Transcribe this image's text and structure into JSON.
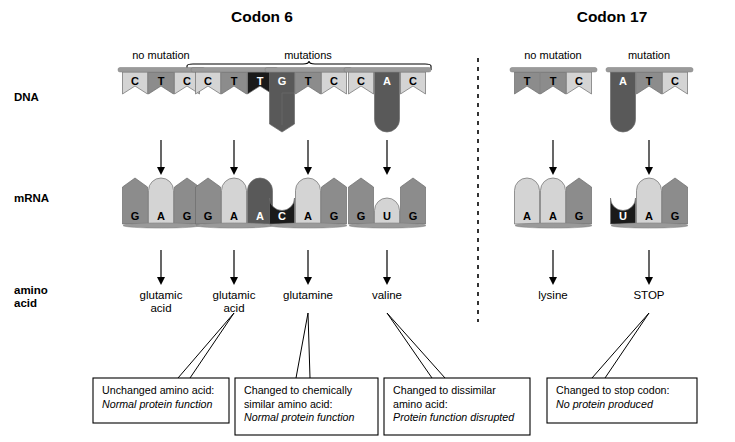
{
  "figure": {
    "width": 735,
    "height": 442,
    "background": "#ffffff"
  },
  "panels": [
    {
      "id": "codon6",
      "title": "Codon 6",
      "title_x": 262,
      "title_y": 22
    },
    {
      "id": "codon17",
      "title": "Codon 17",
      "title_x": 612,
      "title_y": 22
    }
  ],
  "divider": {
    "x": 478,
    "y1": 58,
    "y2": 322,
    "style": "dashed",
    "color": "#000000"
  },
  "row_labels": [
    {
      "name": "dna",
      "lines": [
        "DNA"
      ],
      "x": 14,
      "y": 101
    },
    {
      "name": "mrna",
      "lines": [
        "mRNA"
      ],
      "x": 14,
      "y": 202
    },
    {
      "name": "amino-acid",
      "lines": [
        "amino",
        "acid"
      ],
      "x": 14,
      "y": 294
    }
  ],
  "column_headers": [
    {
      "label": "no mutation",
      "x": 161,
      "y": 59
    },
    {
      "label": "mutations",
      "x": 308,
      "y": 59
    },
    {
      "label": "no mutation",
      "x": 553,
      "y": 59
    },
    {
      "label": "mutation",
      "x": 649,
      "y": 59
    }
  ],
  "bracket": {
    "x1": 187,
    "x2": 431,
    "y": 70,
    "peak_y": 63,
    "label": "mutations"
  },
  "columns": [
    {
      "id": "col1",
      "center": 161,
      "dna": {
        "backbone_x1": 118,
        "backbone_x2": 205,
        "backbone_y": 71,
        "bases": [
          {
            "letter": "C",
            "shade": "light",
            "shape": "flag"
          },
          {
            "letter": "T",
            "shade": "medium",
            "shape": "flag"
          },
          {
            "letter": "C",
            "shade": "light",
            "shape": "flag"
          }
        ]
      },
      "mrna": {
        "baseline_x1": 123,
        "baseline_x2": 200,
        "baseline_y": 228,
        "bases": [
          {
            "letter": "G",
            "shade": "medium",
            "shape": "tall-point"
          },
          {
            "letter": "A",
            "shade": "light",
            "shape": "tall-round"
          },
          {
            "letter": "G",
            "shade": "medium",
            "shape": "tall-point"
          }
        ]
      },
      "amino_acid": {
        "lines": [
          "glutamic",
          "acid"
        ],
        "y": 299
      },
      "callout": null
    },
    {
      "id": "col2",
      "center": 234,
      "dna": {
        "backbone_x1": 191,
        "backbone_x2": 278,
        "backbone_y": 71,
        "bases": [
          {
            "letter": "C",
            "shade": "light",
            "shape": "flag"
          },
          {
            "letter": "T",
            "shade": "medium",
            "shape": "flag"
          },
          {
            "letter": "T",
            "shade": "black",
            "shape": "flag"
          }
        ]
      },
      "mrna": {
        "baseline_x1": 196,
        "baseline_x2": 273,
        "baseline_y": 228,
        "bases": [
          {
            "letter": "G",
            "shade": "medium",
            "shape": "tall-point"
          },
          {
            "letter": "A",
            "shade": "light",
            "shape": "tall-round"
          },
          {
            "letter": "A",
            "shade": "dark",
            "shape": "tall-round"
          }
        ]
      },
      "amino_acid": {
        "lines": [
          "glutamic",
          "acid"
        ],
        "y": 299
      },
      "callout": "box1"
    },
    {
      "id": "col3",
      "center": 308,
      "dna": {
        "backbone_x1": 265,
        "backbone_x2": 352,
        "backbone_y": 71,
        "bases": [
          {
            "letter": "G",
            "shade": "dark",
            "shape": "flag-long-point"
          },
          {
            "letter": "T",
            "shade": "medium",
            "shape": "flag"
          },
          {
            "letter": "C",
            "shade": "light",
            "shape": "flag"
          }
        ]
      },
      "mrna": {
        "baseline_x1": 270,
        "baseline_x2": 347,
        "baseline_y": 228,
        "bases": [
          {
            "letter": "C",
            "shade": "black",
            "shape": "short-notch"
          },
          {
            "letter": "A",
            "shade": "light",
            "shape": "tall-round"
          },
          {
            "letter": "G",
            "shade": "medium",
            "shape": "tall-point"
          }
        ]
      },
      "amino_acid": {
        "lines": [
          "glutamine"
        ],
        "y": 299
      },
      "callout": "box2"
    },
    {
      "id": "col4",
      "center": 387,
      "dna": {
        "backbone_x1": 344,
        "backbone_x2": 431,
        "backbone_y": 71,
        "bases": [
          {
            "letter": "C",
            "shade": "light",
            "shape": "flag"
          },
          {
            "letter": "A",
            "shade": "dark",
            "shape": "flag-long-round"
          },
          {
            "letter": "C",
            "shade": "light",
            "shape": "flag"
          }
        ]
      },
      "mrna": {
        "baseline_x1": 349,
        "baseline_x2": 426,
        "baseline_y": 228,
        "bases": [
          {
            "letter": "G",
            "shade": "medium",
            "shape": "tall-point"
          },
          {
            "letter": "U",
            "shade": "light",
            "shape": "short-round"
          },
          {
            "letter": "G",
            "shade": "medium",
            "shape": "tall-point"
          }
        ]
      },
      "amino_acid": {
        "lines": [
          "valine"
        ],
        "y": 299
      },
      "callout": "box3"
    },
    {
      "id": "col5",
      "center": 553,
      "dna": {
        "backbone_x1": 510,
        "backbone_x2": 597,
        "backbone_y": 71,
        "bases": [
          {
            "letter": "T",
            "shade": "medium",
            "shape": "flag"
          },
          {
            "letter": "T",
            "shade": "medium",
            "shape": "flag"
          },
          {
            "letter": "C",
            "shade": "light",
            "shape": "flag"
          }
        ]
      },
      "mrna": {
        "baseline_x1": 515,
        "baseline_x2": 592,
        "baseline_y": 228,
        "bases": [
          {
            "letter": "A",
            "shade": "light",
            "shape": "tall-round"
          },
          {
            "letter": "A",
            "shade": "light",
            "shape": "tall-round"
          },
          {
            "letter": "G",
            "shade": "medium",
            "shape": "tall-point"
          }
        ]
      },
      "amino_acid": {
        "lines": [
          "lysine"
        ],
        "y": 299
      },
      "callout": null
    },
    {
      "id": "col6",
      "center": 649,
      "dna": {
        "backbone_x1": 606,
        "backbone_x2": 693,
        "backbone_y": 71,
        "bases": [
          {
            "letter": "A",
            "shade": "dark",
            "shape": "flag-long-round"
          },
          {
            "letter": "T",
            "shade": "medium",
            "shape": "flag"
          },
          {
            "letter": "C",
            "shade": "light",
            "shape": "flag"
          }
        ]
      },
      "mrna": {
        "baseline_x1": 611,
        "baseline_x2": 688,
        "baseline_y": 228,
        "bases": [
          {
            "letter": "U",
            "shade": "black",
            "shape": "short-notch"
          },
          {
            "letter": "A",
            "shade": "light",
            "shape": "tall-round"
          },
          {
            "letter": "G",
            "shade": "medium",
            "shape": "tall-point"
          }
        ]
      },
      "amino_acid": {
        "lines": [
          "STOP"
        ],
        "y": 299
      },
      "callout": "box4"
    }
  ],
  "arrows": [
    {
      "name": "arrow-dna-to-mrna-1",
      "x": 161,
      "y1": 140,
      "y2": 175
    },
    {
      "name": "arrow-dna-to-mrna-2",
      "x": 234,
      "y1": 140,
      "y2": 175
    },
    {
      "name": "arrow-dna-to-mrna-3",
      "x": 308,
      "y1": 140,
      "y2": 175
    },
    {
      "name": "arrow-dna-to-mrna-4",
      "x": 387,
      "y1": 140,
      "y2": 175
    },
    {
      "name": "arrow-dna-to-mrna-5",
      "x": 553,
      "y1": 140,
      "y2": 175
    },
    {
      "name": "arrow-dna-to-mrna-6",
      "x": 649,
      "y1": 140,
      "y2": 175
    },
    {
      "name": "arrow-mrna-to-aa-1",
      "x": 161,
      "y1": 250,
      "y2": 285
    },
    {
      "name": "arrow-mrna-to-aa-2",
      "x": 234,
      "y1": 250,
      "y2": 285
    },
    {
      "name": "arrow-mrna-to-aa-3",
      "x": 308,
      "y1": 250,
      "y2": 285
    },
    {
      "name": "arrow-mrna-to-aa-4",
      "x": 387,
      "y1": 250,
      "y2": 285
    },
    {
      "name": "arrow-mrna-to-aa-5",
      "x": 553,
      "y1": 250,
      "y2": 285
    },
    {
      "name": "arrow-mrna-to-aa-6",
      "x": 649,
      "y1": 250,
      "y2": 285
    }
  ],
  "callout_boxes": [
    {
      "id": "box1",
      "x": 93,
      "y": 378,
      "w": 136,
      "h": 45,
      "lines": [
        {
          "text": "Unchanged amino acid:",
          "italic": false
        },
        {
          "text": "Normal protein function",
          "italic": true
        }
      ],
      "leader": {
        "from_x": 234,
        "from_y": 313,
        "tip_x": 178,
        "tip_y": 378,
        "base_x": 190
      }
    },
    {
      "id": "box2",
      "x": 235,
      "y": 378,
      "w": 143,
      "h": 57,
      "lines": [
        {
          "text": "Changed to chemically",
          "italic": false
        },
        {
          "text": "similar amino acid:",
          "italic": false
        },
        {
          "text": "Normal protein function",
          "italic": true
        }
      ],
      "leader": {
        "from_x": 308,
        "from_y": 313,
        "tip_x": 296,
        "tip_y": 378,
        "base_x": 310
      }
    },
    {
      "id": "box3",
      "x": 384,
      "y": 378,
      "w": 146,
      "h": 57,
      "lines": [
        {
          "text": "Changed to dissimilar",
          "italic": false
        },
        {
          "text": "amino acid:",
          "italic": false
        },
        {
          "text": "Protein function disrupted",
          "italic": true
        }
      ],
      "leader": {
        "from_x": 387,
        "from_y": 313,
        "tip_x": 445,
        "tip_y": 378,
        "base_x": 432
      }
    },
    {
      "id": "box4",
      "x": 547,
      "y": 378,
      "w": 150,
      "h": 45,
      "lines": [
        {
          "text": "Changed to stop codon:",
          "italic": false
        },
        {
          "text": "No protein produced",
          "italic": true
        }
      ],
      "leader": {
        "from_x": 649,
        "from_y": 313,
        "tip_x": 592,
        "tip_y": 378,
        "base_x": 605
      }
    }
  ],
  "palette": {
    "light": "#d4d4d4",
    "medium": "#8c8c8c",
    "dark": "#595959",
    "black": "#1a1a1a",
    "stroke": "#6b6b6b",
    "ink": "#000000",
    "backbone": "#9a9a9a"
  },
  "base_text_color": {
    "light": "#000000",
    "medium": "#000000",
    "dark": "#ffffff",
    "black": "#ffffff"
  }
}
